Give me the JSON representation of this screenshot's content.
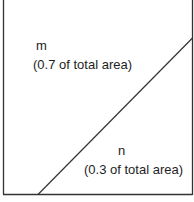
{
  "diagram": {
    "regions": [
      {
        "id": "m",
        "name": "m",
        "description": "(0.7 of total area)"
      },
      {
        "id": "n",
        "name": "n",
        "description": "(0.3 of total area)"
      }
    ],
    "colors": {
      "line": "#333333",
      "background": "#ffffff"
    }
  }
}
